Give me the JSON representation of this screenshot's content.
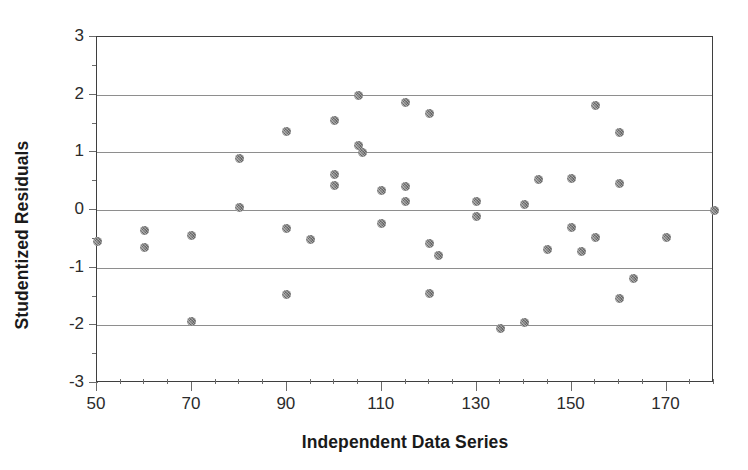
{
  "chart_data": {
    "type": "scatter",
    "title": "",
    "xlabel": "Independent Data Series",
    "ylabel": "Studentized Residuals",
    "xlim": [
      50,
      180
    ],
    "ylim": [
      -3,
      3
    ],
    "xticks": [
      50,
      70,
      90,
      110,
      130,
      150,
      170
    ],
    "xtick_labels": [
      "50",
      "70",
      "90",
      "110",
      "130",
      "150",
      "170"
    ],
    "xtick_step_minor": 5,
    "yticks": [
      -3,
      -2,
      -1,
      0,
      1,
      2,
      3
    ],
    "ytick_labels": [
      "-3",
      "-2",
      "-1",
      "0",
      "1",
      "2",
      "3"
    ],
    "ytick_step_minor": 0.5,
    "grid": "horizontal",
    "gridlines_y": [
      -2,
      -1,
      0,
      1,
      2
    ],
    "legend": "none",
    "marker": {
      "shape": "circle",
      "color": "#808080",
      "size_px": 9,
      "fill": "dithered-gray"
    },
    "series": [
      {
        "name": "Studentized Residuals",
        "points": [
          [
            50,
            -0.55
          ],
          [
            60,
            -0.35
          ],
          [
            60,
            -0.65
          ],
          [
            70,
            -0.45
          ],
          [
            70,
            -1.93
          ],
          [
            80,
            0.89
          ],
          [
            80,
            0.04
          ],
          [
            90,
            1.37
          ],
          [
            90,
            -0.32
          ],
          [
            90,
            -1.46
          ],
          [
            95,
            -0.51
          ],
          [
            100,
            1.55
          ],
          [
            100,
            0.62
          ],
          [
            100,
            0.43
          ],
          [
            105,
            1.99
          ],
          [
            105,
            1.11
          ],
          [
            106,
            0.99
          ],
          [
            110,
            0.34
          ],
          [
            110,
            -0.23
          ],
          [
            115,
            1.87
          ],
          [
            115,
            0.41
          ],
          [
            115,
            0.14
          ],
          [
            120,
            1.68
          ],
          [
            120,
            -0.58
          ],
          [
            120,
            -1.44
          ],
          [
            122,
            -0.79
          ],
          [
            130,
            0.15
          ],
          [
            130,
            -0.11
          ],
          [
            135,
            -2.05
          ],
          [
            140,
            0.09
          ],
          [
            140,
            -1.95
          ],
          [
            143,
            0.53
          ],
          [
            145,
            -0.68
          ],
          [
            150,
            0.55
          ],
          [
            150,
            -0.31
          ],
          [
            152,
            -0.72
          ],
          [
            155,
            1.81
          ],
          [
            155,
            -0.48
          ],
          [
            160,
            1.34
          ],
          [
            160,
            0.46
          ],
          [
            160,
            -1.54
          ],
          [
            163,
            -1.18
          ],
          [
            170,
            -0.48
          ],
          [
            180,
            0.0
          ]
        ]
      }
    ]
  },
  "axes": {
    "frame_color": "#3f3f3f",
    "grid_color": "#8e8e8e",
    "tick_color": "#6b6b6b",
    "text_color": "#2b2b2b",
    "title_color": "#1a1a1a"
  }
}
